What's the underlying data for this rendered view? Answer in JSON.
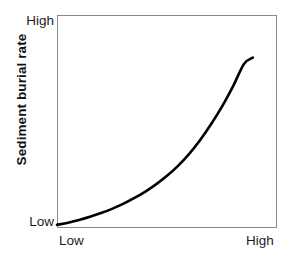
{
  "chart_data": {
    "type": "line",
    "title": "",
    "subtitle": "",
    "xlabel": "",
    "ylabel": "Sediment burial rate",
    "grid": false,
    "legend": false,
    "legend_position": "none",
    "axis": {
      "x_tick_labels": [
        "Low",
        "High"
      ],
      "y_tick_labels": [
        "Low",
        "High"
      ],
      "xlim": [
        0,
        1
      ],
      "ylim": [
        0,
        1
      ],
      "x_tick_positions": [
        0,
        1
      ],
      "y_tick_positions": [
        0,
        1
      ]
    },
    "series": [
      {
        "name": "sediment burial rate curve",
        "style": "solid",
        "color": "#000000",
        "width": 2.6,
        "description": "monotonically increasing convex (exponential-like) curve",
        "x": [
          0.0,
          0.05,
          0.1,
          0.15,
          0.2,
          0.25,
          0.3,
          0.35,
          0.4,
          0.45,
          0.5,
          0.55,
          0.6,
          0.65,
          0.7,
          0.75,
          0.8,
          0.85,
          0.89
        ],
        "y": [
          0.015,
          0.025,
          0.038,
          0.053,
          0.07,
          0.09,
          0.113,
          0.14,
          0.17,
          0.205,
          0.245,
          0.292,
          0.347,
          0.412,
          0.487,
          0.57,
          0.665,
          0.77,
          0.8
        ]
      }
    ],
    "annotations": []
  },
  "axis_labels": {
    "y_title": "Sediment burial rate",
    "y_high": "High",
    "y_low": "Low",
    "x_low": "Low",
    "x_high": "High"
  },
  "colors": {
    "background": "#ffffff",
    "curve": "#000000",
    "frame": "#8a8a8a",
    "text": "#1d1d1d",
    "title_text": "#111111"
  }
}
